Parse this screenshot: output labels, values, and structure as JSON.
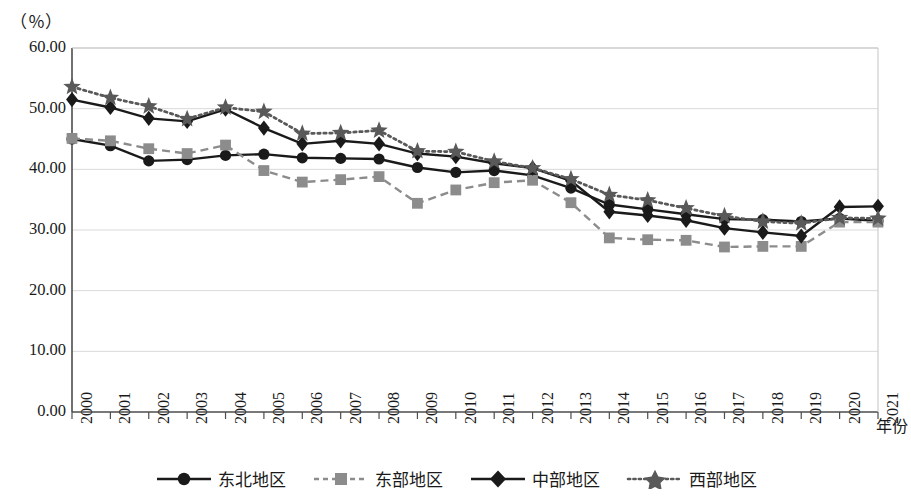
{
  "chart_data": {
    "type": "line",
    "title": "",
    "xlabel": "年份",
    "ylabel": "（％）",
    "unit_label": "（％）",
    "grid": true,
    "legend_position": "bottom",
    "ylim": [
      0,
      60
    ],
    "ytick_labels": [
      "0.00",
      "10.00",
      "20.00",
      "30.00",
      "40.00",
      "50.00",
      "60.00"
    ],
    "ytick_values": [
      0,
      10,
      20,
      30,
      40,
      50,
      60
    ],
    "categories": [
      "2000",
      "2001",
      "2002",
      "2003",
      "2004",
      "2005",
      "2006",
      "2007",
      "2008",
      "2009",
      "2010",
      "2011",
      "2012",
      "2013",
      "2014",
      "2015",
      "2016",
      "2017",
      "2018",
      "2019",
      "2020",
      "2021"
    ],
    "series": [
      {
        "name": "东北地区",
        "marker": "circle",
        "line_style": "solid",
        "color": "#1a1a1a",
        "values": [
          45.0,
          43.9,
          41.4,
          41.6,
          42.3,
          42.5,
          41.9,
          41.8,
          41.7,
          40.3,
          39.5,
          39.8,
          39.0,
          36.9,
          34.2,
          33.4,
          32.6,
          31.8,
          31.7,
          31.4,
          31.9,
          31.5
        ]
      },
      {
        "name": "东部地区",
        "marker": "square",
        "line_style": "dashed",
        "color": "#8c8c8c",
        "values": [
          45.1,
          44.7,
          43.4,
          42.6,
          44.0,
          39.8,
          37.9,
          38.3,
          38.8,
          34.4,
          36.6,
          37.8,
          38.2,
          34.5,
          28.7,
          28.4,
          28.3,
          27.2,
          27.3,
          27.3,
          31.3,
          31.3
        ]
      },
      {
        "name": "中部地区",
        "marker": "diamond",
        "line_style": "solid",
        "color": "#1a1a1a",
        "values": [
          51.5,
          50.2,
          48.4,
          47.9,
          49.9,
          46.8,
          44.2,
          44.7,
          44.2,
          42.6,
          42.1,
          41.0,
          40.2,
          38.1,
          33.0,
          32.4,
          31.6,
          30.3,
          29.6,
          29.0,
          33.8,
          33.9
        ]
      },
      {
        "name": "西部地区",
        "marker": "star",
        "line_style": "dotted",
        "color": "#595959",
        "values": [
          53.6,
          51.8,
          50.4,
          48.3,
          50.2,
          49.5,
          45.9,
          46.0,
          46.4,
          43.0,
          42.9,
          41.3,
          40.2,
          38.4,
          35.8,
          34.9,
          33.6,
          32.3,
          31.4,
          31.1,
          32.0,
          31.9
        ]
      }
    ]
  },
  "legend": {
    "items": [
      {
        "label": "东北地区"
      },
      {
        "label": "东部地区"
      },
      {
        "label": "中部地区"
      },
      {
        "label": "西部地区"
      }
    ]
  }
}
